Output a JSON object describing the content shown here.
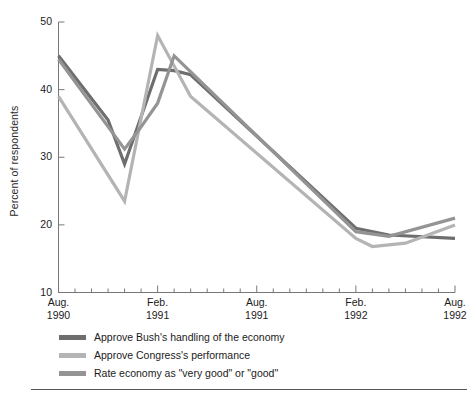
{
  "axis": {
    "ylabel": "Percent of respondents",
    "yticks": [
      "50",
      "40",
      "30",
      "20",
      "10"
    ],
    "xticks": [
      {
        "month": "Aug.",
        "year": "1990"
      },
      {
        "month": "Feb.",
        "year": "1991"
      },
      {
        "month": "Aug.",
        "year": "1991"
      },
      {
        "month": "Feb.",
        "year": "1992"
      },
      {
        "month": "Aug.",
        "year": "1992"
      }
    ]
  },
  "legend": [
    {
      "label": "Approve Bush's handling of the economy",
      "color": "#6e6e6e"
    },
    {
      "label": "Approve Congress's performance",
      "color": "#b4b4b4"
    },
    {
      "label": "Rate economy as \"very good\" or \"good\"",
      "color": "#949494"
    }
  ],
  "chart_data": {
    "type": "line",
    "title": "",
    "xlabel": "",
    "ylabel": "Percent of respondents",
    "ylim": [
      10,
      50
    ],
    "yticks": [
      10,
      20,
      30,
      40,
      50
    ],
    "grid": false,
    "legend_position": "below",
    "x": [
      "Aug. 1990",
      "Sep. 1990",
      "Oct. 1990",
      "Nov. 1990",
      "Dec. 1990",
      "Jan. 1991",
      "Feb. 1991",
      "Mar. 1991",
      "Apr. 1991",
      "May 1991",
      "Jun. 1991",
      "Jul. 1991",
      "Aug. 1991",
      "Sep. 1991",
      "Oct. 1991",
      "Nov. 1991",
      "Dec. 1991",
      "Jan. 1992",
      "Feb. 1992",
      "Mar. 1992",
      "Apr. 1992",
      "May 1992",
      "Jun. 1992",
      "Jul. 1992",
      "Aug. 1992"
    ],
    "x_tick_indices": [
      0,
      6,
      12,
      18,
      24
    ],
    "series": [
      {
        "name": "Approve Bush's handling of the economy",
        "color": "#6e6e6e",
        "points": [
          {
            "x": "Aug. 1990",
            "y": 45.0
          },
          {
            "x": "Nov. 1990",
            "y": 35.5
          },
          {
            "x": "Dec. 1990",
            "y": 29.0
          },
          {
            "x": "Feb. 1991",
            "y": 43.0
          },
          {
            "x": "Mar. 1991",
            "y": 42.8
          },
          {
            "x": "Apr. 1991",
            "y": 42.2
          },
          {
            "x": "Feb. 1992",
            "y": 19.5
          },
          {
            "x": "Apr. 1992",
            "y": 18.5
          },
          {
            "x": "Aug. 1992",
            "y": 18.0
          }
        ]
      },
      {
        "name": "Approve Congress's performance",
        "color": "#b4b4b4",
        "points": [
          {
            "x": "Aug. 1990",
            "y": 39.0
          },
          {
            "x": "Dec. 1990",
            "y": 23.5
          },
          {
            "x": "Feb. 1991",
            "y": 48.0
          },
          {
            "x": "Apr. 1991",
            "y": 39.0
          },
          {
            "x": "Feb. 1992",
            "y": 18.0
          },
          {
            "x": "Mar. 1992",
            "y": 16.8
          },
          {
            "x": "May 1992",
            "y": 17.3
          },
          {
            "x": "Aug. 1992",
            "y": 20.0
          }
        ]
      },
      {
        "name": "Rate economy as \"very good\" or \"good\"",
        "color": "#949494",
        "points": [
          {
            "x": "Aug. 1990",
            "y": 44.5
          },
          {
            "x": "Dec. 1990",
            "y": 31.2
          },
          {
            "x": "Jan. 1991",
            "y": 34.5
          },
          {
            "x": "Feb. 1991",
            "y": 38.0
          },
          {
            "x": "Mar. 1991",
            "y": 45.0
          },
          {
            "x": "Feb. 1992",
            "y": 19.0
          },
          {
            "x": "Apr. 1992",
            "y": 18.3
          },
          {
            "x": "Aug. 1992",
            "y": 21.0
          }
        ]
      }
    ]
  }
}
